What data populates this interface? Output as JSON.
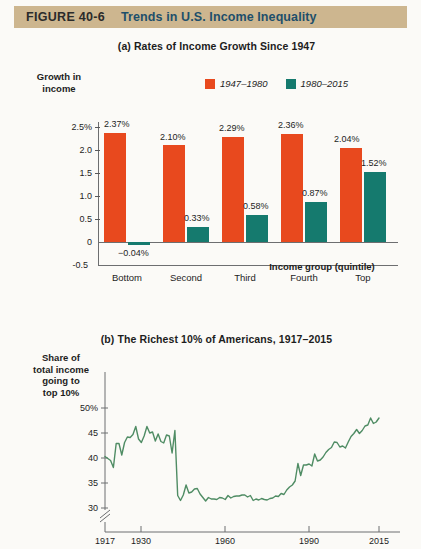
{
  "header": {
    "figure_number": "FIGURE  40-6",
    "title": "Trends in U.S. Income Inequality"
  },
  "panel_a": {
    "title": "(a) Rates of Income Growth Since 1947",
    "ylabel": "Growth in\nincome",
    "xlabel": "Income group (quintile)",
    "legend": [
      {
        "label": "1947–1980",
        "color": "#e8491e"
      },
      {
        "label": "1980–2015",
        "color": "#157a6e"
      }
    ],
    "ytick_labels": [
      "2.5%",
      "2.0",
      "1.5",
      "1.0",
      "0.5",
      "0",
      "-0.5"
    ],
    "categories": [
      "Bottom",
      "Second",
      "Third",
      "Fourth",
      "Top"
    ],
    "value_labels_1947": [
      "2.37%",
      "2.10%",
      "2.29%",
      "2.36%",
      "2.04%"
    ],
    "value_labels_1980": [
      "−0.04%",
      "0.33%",
      "0.58%",
      "0.87%",
      "1.52%"
    ]
  },
  "panel_b": {
    "title": "(b) The Richest 10% of Americans, 1917–2015",
    "ylabel": "Share of\ntotal income\ngoing to\ntop 10%",
    "ytick_labels": [
      "50%",
      "45",
      "40",
      "35",
      "30"
    ],
    "xtick_labels": [
      "1917",
      "1930",
      "1960",
      "1990",
      "2015"
    ],
    "line_color": "#4f8c64"
  },
  "chart_data": [
    {
      "type": "bar",
      "title": "(a) Rates of Income Growth Since 1947",
      "xlabel": "Income group (quintile)",
      "ylabel": "Growth in income",
      "categories": [
        "Bottom",
        "Second",
        "Third",
        "Fourth",
        "Top"
      ],
      "series": [
        {
          "name": "1947–1980",
          "color": "#e8491e",
          "values": [
            2.37,
            2.1,
            2.29,
            2.36,
            2.04
          ]
        },
        {
          "name": "1980–2015",
          "color": "#157a6e",
          "values": [
            -0.04,
            0.33,
            0.58,
            0.87,
            1.52
          ]
        }
      ],
      "ylim": [
        -0.5,
        2.7
      ],
      "yticks": [
        -0.5,
        0,
        0.5,
        1.0,
        1.5,
        2.0,
        2.5
      ],
      "grid": false,
      "legend_position": "top-right"
    },
    {
      "type": "line",
      "title": "(b) The Richest 10% of Americans, 1917–2015",
      "xlabel": "",
      "ylabel": "Share of total income going to top 10%",
      "ylim": [
        28,
        51
      ],
      "yticks": [
        30,
        35,
        40,
        45,
        50
      ],
      "xlim": [
        1917,
        2015
      ],
      "xticks": [
        1917,
        1930,
        1960,
        1990,
        2015
      ],
      "axis_break_y": true,
      "grid": false,
      "series": [
        {
          "name": "Top 10% income share",
          "color": "#4f8c64",
          "x": [
            1917,
            1918,
            1919,
            1920,
            1921,
            1922,
            1923,
            1924,
            1925,
            1926,
            1927,
            1928,
            1929,
            1930,
            1931,
            1932,
            1933,
            1934,
            1935,
            1936,
            1937,
            1938,
            1939,
            1940,
            1941,
            1942,
            1943,
            1944,
            1945,
            1946,
            1947,
            1948,
            1949,
            1950,
            1951,
            1952,
            1953,
            1954,
            1955,
            1956,
            1957,
            1958,
            1959,
            1960,
            1961,
            1962,
            1963,
            1964,
            1965,
            1966,
            1967,
            1968,
            1969,
            1970,
            1971,
            1972,
            1973,
            1974,
            1975,
            1976,
            1977,
            1978,
            1979,
            1980,
            1981,
            1982,
            1983,
            1984,
            1985,
            1986,
            1987,
            1988,
            1989,
            1990,
            1991,
            1992,
            1993,
            1994,
            1995,
            1996,
            1997,
            1998,
            1999,
            2000,
            2001,
            2002,
            2003,
            2004,
            2005,
            2006,
            2007,
            2008,
            2009,
            2010,
            2011,
            2012,
            2013,
            2014,
            2015
          ],
          "values": [
            40.3,
            39.9,
            39.5,
            38.1,
            42.9,
            42.9,
            40.6,
            43.1,
            44.2,
            44.1,
            44.7,
            46.3,
            43.8,
            43.1,
            44.4,
            46.3,
            45.0,
            45.2,
            43.4,
            44.8,
            43.3,
            43.0,
            44.6,
            44.4,
            41.0,
            45.5,
            32.5,
            31.5,
            32.6,
            34.6,
            33.0,
            33.2,
            33.8,
            33.9,
            32.8,
            32.1,
            31.4,
            32.1,
            31.8,
            31.8,
            31.7,
            32.1,
            32.0,
            31.7,
            32.5,
            32.0,
            32.3,
            32.4,
            32.4,
            32.6,
            32.6,
            32.2,
            32.5,
            31.5,
            31.8,
            31.6,
            31.9,
            31.7,
            31.6,
            31.9,
            32.0,
            32.4,
            32.3,
            32.9,
            32.7,
            33.6,
            34.2,
            34.6,
            35.4,
            38.9,
            36.5,
            38.6,
            38.6,
            38.8,
            38.4,
            40.8,
            39.4,
            39.6,
            40.2,
            41.1,
            41.7,
            42.1,
            43.2,
            43.1,
            42.2,
            42.4,
            42.0,
            43.2,
            44.3,
            44.9,
            45.7,
            44.9,
            45.5,
            46.4,
            46.6,
            48.0,
            46.9,
            47.2,
            48.0
          ]
        }
      ]
    }
  ]
}
